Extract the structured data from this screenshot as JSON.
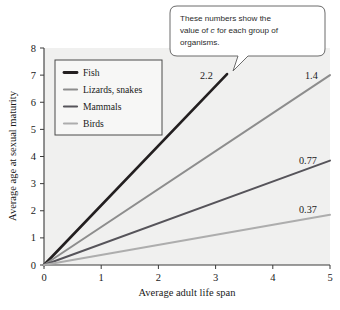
{
  "chart_data": {
    "type": "line",
    "title": "",
    "xlabel": "Average adult life span",
    "ylabel": "Average age at sexual maturity",
    "xlim": [
      0,
      5
    ],
    "ylim": [
      0,
      8
    ],
    "xticks": [
      "0",
      "1",
      "2",
      "3",
      "4",
      "5"
    ],
    "yticks": [
      "0",
      "1",
      "2",
      "3",
      "4",
      "5",
      "6",
      "7",
      "8"
    ],
    "grid": false,
    "legend_position": "upper-left-inside",
    "series": [
      {
        "name": "Fish",
        "slope_label": "2.2",
        "slope": 2.2,
        "color": "#231f20",
        "x": [
          0,
          3.2
        ],
        "values": [
          0,
          7.04
        ]
      },
      {
        "name": "Lizards, snakes",
        "slope_label": "1.4",
        "slope": 1.4,
        "color": "#8d8d8d",
        "x": [
          0,
          5
        ],
        "values": [
          0,
          7.0
        ]
      },
      {
        "name": "Mammals",
        "slope_label": "0.77",
        "slope": 0.77,
        "color": "#56545a",
        "x": [
          0,
          5
        ],
        "values": [
          0,
          3.85
        ]
      },
      {
        "name": "Birds",
        "slope_label": "0.37",
        "slope": 0.37,
        "color": "#adadad",
        "x": [
          0,
          5
        ],
        "values": [
          0,
          1.85
        ]
      }
    ],
    "annotations": [
      {
        "text": "These numbers show the",
        "role": "callout-line-1"
      },
      {
        "text": "value of c for each group of",
        "role": "callout-line-2"
      },
      {
        "text": "organisms.",
        "role": "callout-line-3"
      }
    ]
  },
  "callout": {
    "line1_pre": "These numbers show the",
    "line2_pre": "value of ",
    "line2_italic": "c",
    "line2_post": " for each group of",
    "line3": "organisms."
  },
  "legend": {
    "items": [
      {
        "label": "Fish"
      },
      {
        "label": "Lizards, snakes"
      },
      {
        "label": "Mammals"
      },
      {
        "label": "Birds"
      }
    ]
  },
  "labels": {
    "fish_value": "2.2",
    "lizards_value": "1.4",
    "mammals_value": "0.77",
    "birds_value": "0.37"
  },
  "axes": {
    "x_title": "Average adult life span",
    "y_title": "Average age at sexual maturity",
    "x_ticks": [
      "0",
      "1",
      "2",
      "3",
      "4",
      "5"
    ],
    "y_ticks": [
      "0",
      "1",
      "2",
      "3",
      "4",
      "5",
      "6",
      "7",
      "8"
    ]
  },
  "colors": {
    "fish": "#231f20",
    "lizards": "#8d8d8d",
    "mammals": "#56545a",
    "birds": "#adadad",
    "plot_bg": "#f0f0ef",
    "axis": "#3a3a3a"
  }
}
